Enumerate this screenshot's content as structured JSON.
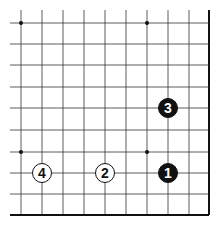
{
  "board": {
    "title": "",
    "edge_right": true,
    "edge_bottom": true,
    "columns_x": [
      21,
      42,
      63,
      84,
      105,
      126,
      147,
      168,
      189,
      209
    ],
    "rows_y": [
      23,
      44,
      65,
      87,
      108,
      130,
      152,
      173,
      194,
      215
    ],
    "line_color": "#333333",
    "edge_color": "#111111",
    "star_points": [
      {
        "col": 0,
        "row": 0
      },
      {
        "col": 6,
        "row": 0
      },
      {
        "col": 0,
        "row": 6
      },
      {
        "col": 6,
        "row": 6
      }
    ],
    "stones": [
      {
        "number": "1",
        "color": "black",
        "col": 7,
        "row": 7
      },
      {
        "number": "2",
        "color": "white",
        "col": 4,
        "row": 7
      },
      {
        "number": "3",
        "color": "black",
        "col": 7,
        "row": 4
      },
      {
        "number": "4",
        "color": "white",
        "col": 1,
        "row": 7
      }
    ]
  }
}
